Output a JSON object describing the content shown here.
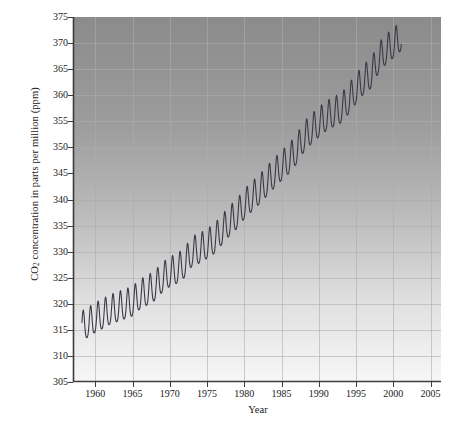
{
  "chart_data": {
    "type": "line",
    "title": "",
    "xlabel": "Year",
    "ylabel": "CO2 concentration in parts per million (ppm)",
    "ylabel_parts": {
      "pre": "CO",
      "sub": "2",
      "post": " concentration in parts per million (ppm)"
    },
    "xlim": [
      1957.0,
      2006.4
    ],
    "ylim": [
      305,
      375
    ],
    "xticks": [
      1960,
      1965,
      1970,
      1975,
      1980,
      1985,
      1990,
      1995,
      2000,
      2005
    ],
    "yticks": [
      305,
      310,
      315,
      320,
      325,
      330,
      335,
      340,
      345,
      350,
      355,
      360,
      365,
      370,
      375
    ],
    "xtick_labels": [
      "1960",
      "1965",
      "1970",
      "1975",
      "1980",
      "1985",
      "1990",
      "1995",
      "2000",
      "2005"
    ],
    "ytick_labels": [
      "305",
      "310",
      "315",
      "320",
      "325",
      "330",
      "335",
      "340",
      "345",
      "350",
      "355",
      "360",
      "365",
      "370",
      "375"
    ],
    "grid": true,
    "legend": null,
    "series": [
      {
        "name": "Mauna Loa monthly mean CO2",
        "line_color": "#3a3a46",
        "line_width": 1.1,
        "seasonal_amplitude_ppm": 3.1,
        "x_start": 1958.2,
        "x_end": 2001.1,
        "annual_mean": [
          {
            "year": 1958.2,
            "value": 315.3
          },
          {
            "year": 1959,
            "value": 315.98
          },
          {
            "year": 1960,
            "value": 316.91
          },
          {
            "year": 1961,
            "value": 317.64
          },
          {
            "year": 1962,
            "value": 318.45
          },
          {
            "year": 1963,
            "value": 318.99
          },
          {
            "year": 1964,
            "value": 319.5
          },
          {
            "year": 1965,
            "value": 320.04
          },
          {
            "year": 1966,
            "value": 321.38
          },
          {
            "year": 1967,
            "value": 322.16
          },
          {
            "year": 1968,
            "value": 323.04
          },
          {
            "year": 1969,
            "value": 324.62
          },
          {
            "year": 1970,
            "value": 325.68
          },
          {
            "year": 1971,
            "value": 326.32
          },
          {
            "year": 1972,
            "value": 327.45
          },
          {
            "year": 1973,
            "value": 329.68
          },
          {
            "year": 1974,
            "value": 330.17
          },
          {
            "year": 1975,
            "value": 331.08
          },
          {
            "year": 1976,
            "value": 332.05
          },
          {
            "year": 1977,
            "value": 333.78
          },
          {
            "year": 1978,
            "value": 335.41
          },
          {
            "year": 1979,
            "value": 336.78
          },
          {
            "year": 1980,
            "value": 338.68
          },
          {
            "year": 1981,
            "value": 340.1
          },
          {
            "year": 1982,
            "value": 341.44
          },
          {
            "year": 1983,
            "value": 343.03
          },
          {
            "year": 1984,
            "value": 344.58
          },
          {
            "year": 1985,
            "value": 346.04
          },
          {
            "year": 1986,
            "value": 347.39
          },
          {
            "year": 1987,
            "value": 349.16
          },
          {
            "year": 1988,
            "value": 351.56
          },
          {
            "year": 1989,
            "value": 353.07
          },
          {
            "year": 1990,
            "value": 354.35
          },
          {
            "year": 1991,
            "value": 355.57
          },
          {
            "year": 1992,
            "value": 356.38
          },
          {
            "year": 1993,
            "value": 357.07
          },
          {
            "year": 1994,
            "value": 358.82
          },
          {
            "year": 1995,
            "value": 360.8
          },
          {
            "year": 1996,
            "value": 362.59
          },
          {
            "year": 1997,
            "value": 363.71
          },
          {
            "year": 1998,
            "value": 366.65
          },
          {
            "year": 1999,
            "value": 368.33
          },
          {
            "year": 2000,
            "value": 369.52
          },
          {
            "year": 2001.1,
            "value": 371.0
          }
        ]
      }
    ],
    "plot_area": {
      "left": 73,
      "top": 17,
      "right": 441,
      "bottom": 382
    },
    "background": {
      "gradient_top": "#8e8e8e",
      "gradient_bottom": "#f6f6f6",
      "grid_color": "#b0b0b0",
      "axis_color": "#3c3c3c"
    }
  }
}
